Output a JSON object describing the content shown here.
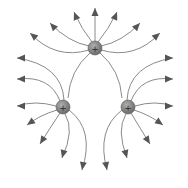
{
  "diagram": {
    "colors": {
      "background": "#ffffff",
      "field_line": "#8a8a8a",
      "arrowhead": "#555555",
      "charge_fill": "#7a7a7a",
      "charge_highlight": "#a8a8a8",
      "charge_sign": "#2a2a2a"
    },
    "charges": [
      {
        "id": "top",
        "sign": "+",
        "x": 95,
        "y": 48,
        "r": 7
      },
      {
        "id": "bottom-left",
        "sign": "+",
        "x": 63,
        "y": 107,
        "r": 7
      },
      {
        "id": "bottom-right",
        "sign": "+",
        "x": 128,
        "y": 107,
        "r": 7
      }
    ],
    "field_lines": {
      "top": [
        "M95 41 L95 8",
        "M92 42 Q82 30 74 12",
        "M98 42 Q108 30 117 12",
        "M89 46 Q68 42 50 23",
        "M101 46 Q122 42 140 23",
        "M89 50 Q55 60 30 33",
        "M101 50 Q135 60 160 33",
        "M90 53 Q70 70 68 98",
        "M100 53 Q120 70 122 98"
      ],
      "bottom_left": [
        "M64 100 Q62 65 17 58",
        "M60 101 Q50 75 17 79",
        "M56 106 Q35 100 17 106",
        "M57 110 Q40 115 27 125",
        "M60 113 Q50 128 40 144",
        "M65 114 Q75 130 62 158",
        "M69 110 Q95 130 82 170"
      ],
      "bottom_right": [
        "M127 100 Q129 65 173 58",
        "M131 101 Q141 75 173 79",
        "M135 106 Q155 100 173 106",
        "M134 110 Q150 115 163 125",
        "M131 113 Q140 128 150 144",
        "M126 114 Q116 130 127 158",
        "M122 110 Q96 130 107 170"
      ]
    },
    "arrowheads": [
      {
        "x": 95,
        "y": 8,
        "angle": -90
      },
      {
        "x": 74,
        "y": 12,
        "angle": -112
      },
      {
        "x": 117,
        "y": 12,
        "angle": -68
      },
      {
        "x": 50,
        "y": 23,
        "angle": -133
      },
      {
        "x": 140,
        "y": 23,
        "angle": -47
      },
      {
        "x": 30,
        "y": 33,
        "angle": -140
      },
      {
        "x": 160,
        "y": 33,
        "angle": -40
      },
      {
        "x": 17,
        "y": 58,
        "angle": 180
      },
      {
        "x": 173,
        "y": 58,
        "angle": 0
      },
      {
        "x": 17,
        "y": 79,
        "angle": 180
      },
      {
        "x": 173,
        "y": 79,
        "angle": 0
      },
      {
        "x": 17,
        "y": 106,
        "angle": 180
      },
      {
        "x": 173,
        "y": 106,
        "angle": 0
      },
      {
        "x": 27,
        "y": 125,
        "angle": 145
      },
      {
        "x": 163,
        "y": 125,
        "angle": 35
      },
      {
        "x": 40,
        "y": 144,
        "angle": 122
      },
      {
        "x": 150,
        "y": 144,
        "angle": 58
      },
      {
        "x": 62,
        "y": 158,
        "angle": 105
      },
      {
        "x": 127,
        "y": 158,
        "angle": 75
      },
      {
        "x": 82,
        "y": 170,
        "angle": 100
      },
      {
        "x": 107,
        "y": 170,
        "angle": 80
      }
    ]
  }
}
